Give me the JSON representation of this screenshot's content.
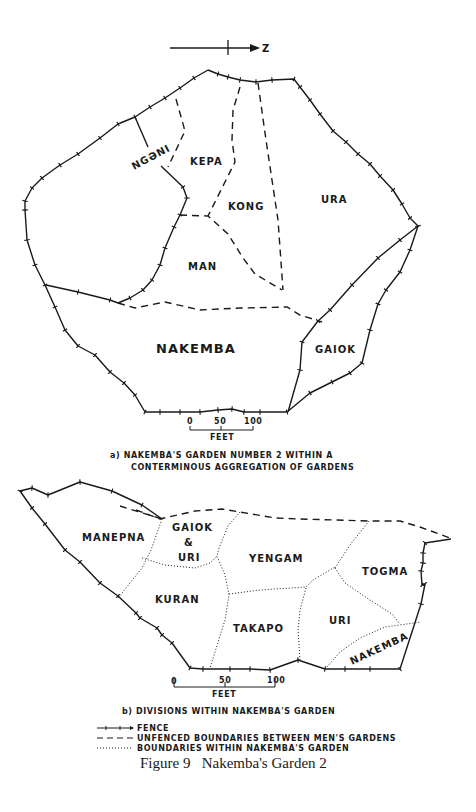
{
  "north_arrow": {
    "label": "Z"
  },
  "map_a": {
    "gardens": [
      {
        "name": "NGƏNI"
      },
      {
        "name": "KEPA"
      },
      {
        "name": "KONG"
      },
      {
        "name": "URA"
      },
      {
        "name": "MAN"
      },
      {
        "name": "NAKEMBA"
      },
      {
        "name": "GAIOK"
      }
    ],
    "scale": {
      "ticks": [
        "0",
        "50",
        "100"
      ],
      "unit": "FEET"
    },
    "caption_line1": "a)  NAKEMBA'S GARDEN NUMBER 2 WITHIN A",
    "caption_line2": "CONTERMINOUS AGGREGATION OF GARDENS"
  },
  "map_b": {
    "divisions": [
      {
        "name": "MANEPNA"
      },
      {
        "name": "GAIOK"
      },
      {
        "name": "&"
      },
      {
        "name": "URI"
      },
      {
        "name": "YENGAM"
      },
      {
        "name": "TOGMA"
      },
      {
        "name": "KURAN"
      },
      {
        "name": "TAKAPO"
      },
      {
        "name": "URI"
      },
      {
        "name": "NAKEMBA"
      }
    ],
    "scale": {
      "ticks": [
        "0",
        "50",
        "100"
      ],
      "unit": "FEET"
    },
    "caption": "b) DIVISIONS WITHIN NAKEMBA'S GARDEN"
  },
  "legend": [
    {
      "symbol": "fence",
      "label": "FENCE"
    },
    {
      "symbol": "dashed",
      "label": "UNFENCED BOUNDARIES BETWEEN MEN'S GARDENS"
    },
    {
      "symbol": "dotted",
      "label": "BOUNDARIES WITHIN NAKEMBA'S GARDEN"
    }
  ],
  "figure_title": "Figure 9   Nakemba's Garden 2"
}
